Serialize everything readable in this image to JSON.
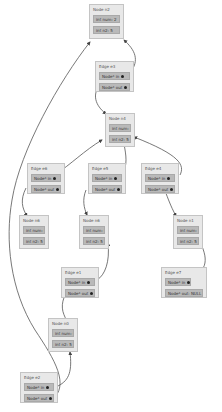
{
  "diagram": {
    "type": "linked-structure-graph",
    "colors": {
      "box_bg": "#e8e8e8",
      "field_bg": "#b9b9b9",
      "arrow": "#555555"
    },
    "nodes": [
      {
        "id": "n2",
        "title": "Node n2",
        "fields": [
          "int num: 2",
          "int n2: 5"
        ]
      },
      {
        "id": "n4",
        "title": "Node n4",
        "fields": [
          "int num: 4",
          "int n2: 5"
        ]
      },
      {
        "id": "n6",
        "title": "Node n6",
        "fields": [
          "int num: 6",
          "int n2: 5"
        ]
      },
      {
        "id": "n6b",
        "title": "Node n6",
        "fields": [
          "int num: 6",
          "int n2: 5"
        ]
      },
      {
        "id": "n1",
        "title": "Node n1",
        "fields": [
          "int num: 1",
          "int n2: 5"
        ]
      },
      {
        "id": "n0",
        "title": "Node n0",
        "fields": [
          "int num: 0",
          "int n2: 5"
        ]
      }
    ],
    "edges": [
      {
        "id": "e3",
        "title": "Edge e3",
        "fields": [
          "Node* in",
          "Node* out"
        ]
      },
      {
        "id": "e6",
        "title": "Edge e6",
        "fields": [
          "Node* in",
          "Node* out"
        ]
      },
      {
        "id": "e5",
        "title": "Edge e5",
        "fields": [
          "Node* in",
          "Node* out"
        ]
      },
      {
        "id": "e4",
        "title": "Edge e4",
        "fields": [
          "Node* in",
          "Node* out"
        ]
      },
      {
        "id": "e7",
        "title": "Edge e7",
        "fields": [
          "Node* in",
          "Node* out: NULL"
        ]
      },
      {
        "id": "e1",
        "title": "Edge e1",
        "fields": [
          "Node* in",
          "Node* out"
        ]
      },
      {
        "id": "e2",
        "title": "Edge e2",
        "fields": [
          "Node* in",
          "Node* out"
        ]
      }
    ]
  }
}
